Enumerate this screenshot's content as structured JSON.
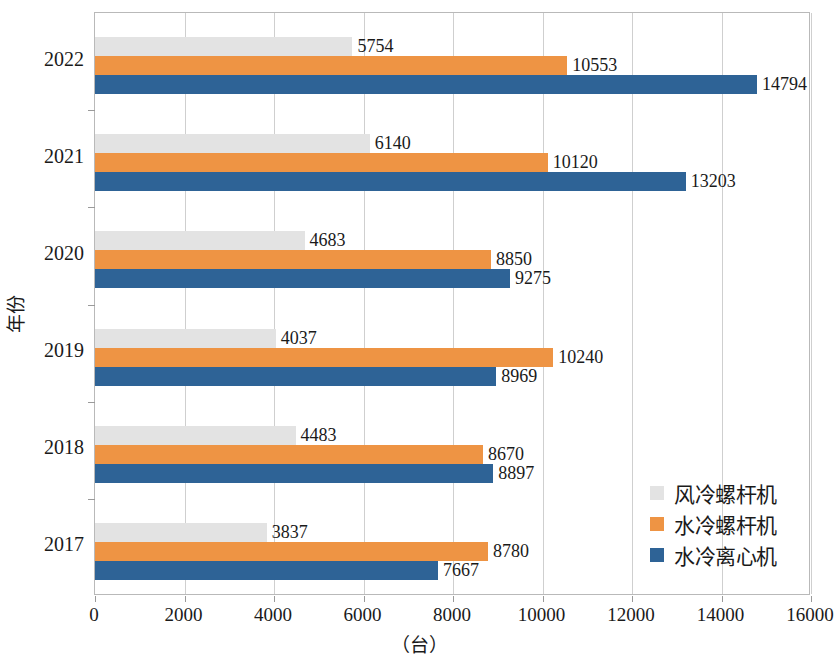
{
  "chart_data": {
    "type": "bar",
    "orientation": "horizontal",
    "title": "",
    "xlabel": "（台）",
    "ylabel": "年份",
    "categories": [
      "2022",
      "2021",
      "2020",
      "2019",
      "2018",
      "2017"
    ],
    "xlim": [
      0,
      16000
    ],
    "xticks": [
      "0",
      "2000",
      "4000",
      "6000",
      "8000",
      "10000",
      "12000",
      "14000",
      "16000"
    ],
    "xtick_values": [
      0,
      2000,
      4000,
      6000,
      8000,
      10000,
      12000,
      14000,
      16000
    ],
    "grid": "vertical",
    "legend_position": "inside-lower-right",
    "series": [
      {
        "name": "风冷螺杆机",
        "color": "#e3e3e3",
        "values": [
          5754,
          6140,
          4683,
          4037,
          4483,
          3837
        ],
        "labels": [
          "5754",
          "6140",
          "4683",
          "4037",
          "4483",
          "3837"
        ]
      },
      {
        "name": "水冷螺杆机",
        "color": "#ee9444",
        "values": [
          10553,
          10120,
          8850,
          10240,
          8670,
          8780
        ],
        "labels": [
          "10553",
          "10120",
          "8850",
          "10240",
          "8670",
          "8780"
        ]
      },
      {
        "name": "水冷离心机",
        "color": "#2e6396",
        "values": [
          14794,
          13203,
          9275,
          8969,
          8897,
          7667
        ],
        "labels": [
          "14794",
          "13203",
          "9275",
          "8969",
          "8897",
          "7667"
        ]
      }
    ]
  },
  "axes": {
    "x_title": "（台）",
    "y_title": "年份"
  },
  "colors": {
    "series_air_cooled_screw": "#e3e3e3",
    "series_water_cooled_screw": "#ee9444",
    "series_water_cooled_centrifugal": "#2e6396",
    "grid": "#cfcfcf",
    "border": "#b9b9b9",
    "text": "#1a1a1a"
  }
}
